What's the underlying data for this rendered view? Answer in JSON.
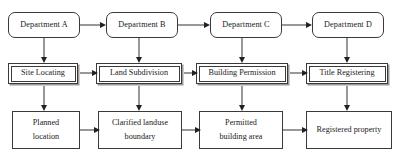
{
  "diagram": {
    "type": "flowchart",
    "orientation": "left-to-right",
    "colors": {
      "stroke": "#3a3a3a",
      "arrow": "#222222",
      "shadow": "#9a9a9a",
      "background": "#ffffff",
      "text": "#1a1a1a"
    },
    "rows": {
      "actors": {
        "shape": "rounded-rectangle",
        "items": [
          {
            "label": "Department A"
          },
          {
            "label": "Department B"
          },
          {
            "label": "Department C"
          },
          {
            "label": "Department D"
          }
        ]
      },
      "processes": {
        "shape": "double-border-rectangle",
        "items": [
          {
            "label": "Site Locating"
          },
          {
            "label": "Land Subdivision"
          },
          {
            "label": "Building Permission"
          },
          {
            "label": "Title Registering"
          }
        ]
      },
      "outputs": {
        "shape": "rectangle",
        "items": [
          {
            "line1": "Planned",
            "line2": "location"
          },
          {
            "line1": "Clarified landuse",
            "line2": "boundary"
          },
          {
            "line1": "Permitted",
            "line2": "building area"
          },
          {
            "line1": "Registered property",
            "line2": ""
          }
        ]
      }
    },
    "connectors": {
      "actor_chain": [
        "Department A → Department B",
        "Department B → Department C",
        "Department C → Department D"
      ],
      "process_chain": [
        "Site Locating → Land Subdivision",
        "Land Subdivision → Building Permission",
        "Building Permission → Title Registering"
      ],
      "output_chain": [
        "Planned location → Clarified landuse boundary",
        "Clarified landuse boundary → Permitted building area",
        "Permitted building area → Registered property"
      ],
      "actor_to_process": [
        "Department A ↓ Site Locating",
        "Department B ↓ Land Subdivision",
        "Department C ↓ Building Permission",
        "Department D ↓ Title Registering"
      ],
      "process_to_output": [
        "Site Locating ↓ Planned location",
        "Land Subdivision ↓ Clarified landuse boundary",
        "Building Permission ↓ Permitted building area",
        "Title Registering ↓ Registered property"
      ]
    }
  }
}
